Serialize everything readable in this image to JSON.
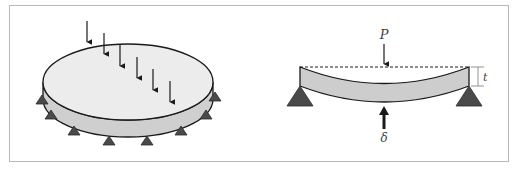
{
  "figure": {
    "left_panel": {
      "name": "circular-plate",
      "description": "Circular plate on edge supports with distributed point loads",
      "load_arrow_count": 6,
      "support_count": 8
    },
    "right_panel": {
      "name": "beam-cross-section",
      "labels": {
        "load": "P",
        "deflection": "δ",
        "thickness": "t"
      }
    },
    "colors": {
      "plate_top": "#ececec",
      "plate_side": "#cfcfcf",
      "beam_fill": "#cdcdcd",
      "support": "#4a4a4a",
      "stroke": "#1a1a1a",
      "frame_border": "#b8b8b8"
    }
  }
}
